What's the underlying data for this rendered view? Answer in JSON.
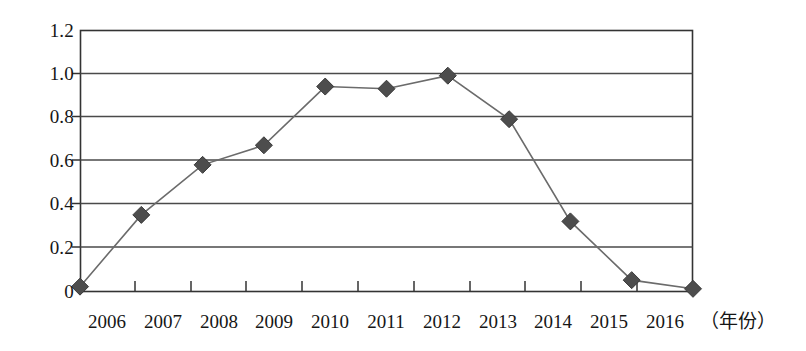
{
  "chart_data": {
    "type": "line",
    "title": "",
    "subtitle": "",
    "xlabel": "（年份）",
    "ylabel": "",
    "categories": [
      "2006",
      "2007",
      "2008",
      "2009",
      "2010",
      "2011",
      "2012",
      "2013",
      "2014",
      "2015",
      "2016"
    ],
    "x": [
      2006,
      2007,
      2008,
      2009,
      2010,
      2011,
      2012,
      2013,
      2014,
      2015,
      2016
    ],
    "series": [
      {
        "name": "series-1",
        "values": [
          0.02,
          0.35,
          0.58,
          0.67,
          0.94,
          0.93,
          0.99,
          0.79,
          0.32,
          0.05,
          0.01
        ],
        "marker": "diamond",
        "color": "#4d4d4d",
        "line_color": "#6b6b6b"
      }
    ],
    "ylim": [
      0,
      1.2
    ],
    "y_ticks": [
      0,
      0.2,
      0.4,
      0.6,
      0.8,
      1.0,
      1.2
    ],
    "y_tick_labels": [
      "0",
      "0.2",
      "0.4",
      "0.6",
      "0.8",
      "1.0",
      "1.2"
    ],
    "x_tick_labels": [
      "2006",
      "2007",
      "2008",
      "2009",
      "2010",
      "2011",
      "2012",
      "2013",
      "2014",
      "2015",
      "2016"
    ],
    "grid": "horizontal",
    "legend": "none",
    "legend_position": "none",
    "plot_border": true,
    "axis_color": "#333333",
    "grid_color": "#555555",
    "background": "#ffffff"
  }
}
